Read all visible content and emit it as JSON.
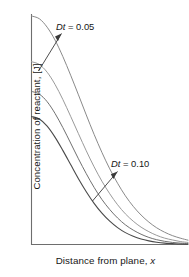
{
  "chart_data": {
    "type": "line",
    "title": "",
    "subtitle": "",
    "xlabel_plain": "Distance from plane, ",
    "xlabel_italic": "x",
    "ylabel": "Concentration of reactant, [J]",
    "xlim": [
      0,
      1
    ],
    "ylim": [
      0,
      1
    ],
    "grid": false,
    "legend_position": "none",
    "axis_ticks": [],
    "axes_style": "L-shaped spine, no tick marks, no numeric tick labels",
    "x": [
      0,
      0.05,
      0.1,
      0.15,
      0.2,
      0.25,
      0.3,
      0.35,
      0.4,
      0.45,
      0.5,
      0.55,
      0.6,
      0.65,
      0.7,
      0.75,
      0.8,
      0.85,
      0.9,
      0.95,
      1.0
    ],
    "series": [
      {
        "name": "Dt = 0.05",
        "Dt": 0.05,
        "color": "#8a8a8a",
        "stroke_width": 1.0,
        "values": [
          1.0,
          0.988,
          0.951,
          0.895,
          0.823,
          0.741,
          0.655,
          0.567,
          0.482,
          0.403,
          0.331,
          0.268,
          0.213,
          0.167,
          0.129,
          0.098,
          0.073,
          0.054,
          0.039,
          0.028,
          0.019
        ]
      },
      {
        "name": "Dt = 0.066",
        "Dt": 0.066,
        "color": "#9a9a9a",
        "stroke_width": 1.0,
        "values": [
          0.8,
          0.788,
          0.754,
          0.701,
          0.635,
          0.561,
          0.485,
          0.41,
          0.34,
          0.277,
          0.222,
          0.174,
          0.134,
          0.102,
          0.076,
          0.056,
          0.04,
          0.028,
          0.02,
          0.013,
          0.009
        ]
      },
      {
        "name": "Dt = 0.083",
        "Dt": 0.083,
        "color": "#707070",
        "stroke_width": 1.0,
        "values": [
          0.67,
          0.658,
          0.625,
          0.574,
          0.512,
          0.444,
          0.375,
          0.31,
          0.25,
          0.197,
          0.153,
          0.116,
          0.086,
          0.063,
          0.045,
          0.031,
          0.021,
          0.014,
          0.009,
          0.006,
          0.004
        ]
      },
      {
        "name": "Dt = 0.10",
        "Dt": 0.1,
        "color": "#4a4a4a",
        "stroke_width": 1.1,
        "values": [
          0.56,
          0.549,
          0.518,
          0.47,
          0.412,
          0.35,
          0.288,
          0.231,
          0.18,
          0.137,
          0.102,
          0.074,
          0.052,
          0.036,
          0.024,
          0.016,
          0.01,
          0.006,
          0.004,
          0.002,
          0.001
        ]
      }
    ],
    "annotations": [
      {
        "id": "ann-dt-005",
        "prefix_italic": "Dt",
        "suffix": " = 0.05",
        "text": "Dt = 0.05",
        "points_to_series": "Dt = 0.05"
      },
      {
        "id": "ann-dt-010",
        "prefix_italic": "Dt",
        "suffix": " = 0.10",
        "text": "Dt = 0.10",
        "points_to_series": "Dt = 0.10"
      }
    ]
  }
}
